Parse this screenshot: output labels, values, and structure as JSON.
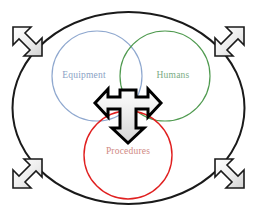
{
  "diagram": {
    "background_color": "#ffffff",
    "boundary": {
      "name": "system-boundary-ellipse",
      "shape": "ellipse",
      "stroke_color": "#1a1a1a",
      "stroke_width": 2,
      "fill": "none",
      "cx": 128.5,
      "cy": 108,
      "rx": 116,
      "ry": 96
    },
    "circles": [
      {
        "id": "equipment",
        "label": "Equipment",
        "stroke_color": "#8fa8cf",
        "label_color": "#8a9fc4",
        "stroke_width": 1.2,
        "cx": 97,
        "cy": 76,
        "r": 45
      },
      {
        "id": "humans",
        "label": "Humans",
        "stroke_color": "#4f9a4f",
        "label_color": "#7aab84",
        "stroke_width": 1.2,
        "cx": 165,
        "cy": 76,
        "r": 45
      },
      {
        "id": "procedures",
        "label": "Procedures",
        "stroke_color": "#e02020",
        "label_color": "#d08a84",
        "stroke_width": 1.4,
        "cx": 128,
        "cy": 155,
        "r": 44
      }
    ],
    "center_arrow": {
      "name": "three-way-interaction-arrow",
      "directions": [
        "left",
        "right",
        "down"
      ],
      "fill_color": "#e8e8e8",
      "stroke_color": "#000000",
      "stroke_width": 3
    },
    "expansion_arrows": [
      {
        "id": "top-left",
        "name": "expansion-arrow-top-left",
        "direction": "up-left",
        "fill_color": "#eaeaea",
        "stroke_color": "#1a1a1a"
      },
      {
        "id": "top-right",
        "name": "expansion-arrow-top-right",
        "direction": "up-right",
        "fill_color": "#eaeaea",
        "stroke_color": "#1a1a1a"
      },
      {
        "id": "bottom-left",
        "name": "expansion-arrow-bottom-left",
        "direction": "down-left",
        "fill_color": "#eaeaea",
        "stroke_color": "#1a1a1a"
      },
      {
        "id": "bottom-right",
        "name": "expansion-arrow-bottom-right",
        "direction": "down-right",
        "fill_color": "#eaeaea",
        "stroke_color": "#1a1a1a"
      }
    ]
  }
}
